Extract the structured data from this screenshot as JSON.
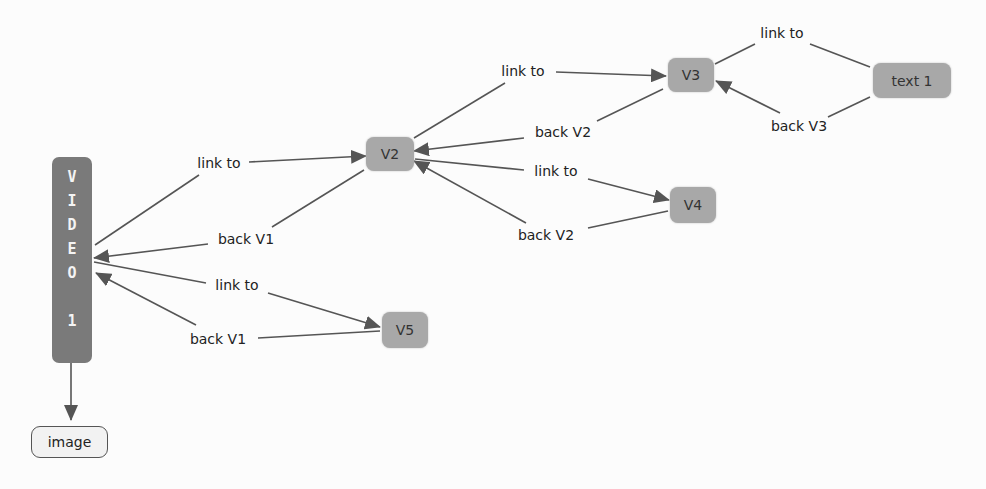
{
  "diagram": {
    "type": "concept-map",
    "colors": {
      "background": "#fcfcfc",
      "node_gray": "#a8a8a8",
      "node_dark": "#7a7a7a",
      "node_light": "#f2f2f2",
      "edge": "#555555"
    },
    "nodes": {
      "video1": {
        "label": "VIDEO 1",
        "letters": [
          "V",
          "I",
          "D",
          "E",
          "O",
          "",
          "1"
        ]
      },
      "image": {
        "label": "image"
      },
      "v2": {
        "label": "V2"
      },
      "v3": {
        "label": "V3"
      },
      "v4": {
        "label": "V4"
      },
      "v5": {
        "label": "V5"
      },
      "text1": {
        "label": "text 1"
      }
    },
    "edges": [
      {
        "from": "VIDEO 1",
        "to": "V2",
        "label": "link to"
      },
      {
        "from": "V2",
        "to": "VIDEO 1",
        "label": "back V1"
      },
      {
        "from": "VIDEO 1",
        "to": "V5",
        "label": "link to"
      },
      {
        "from": "V5",
        "to": "VIDEO 1",
        "label": "back V1"
      },
      {
        "from": "V2",
        "to": "V3",
        "label": "link to"
      },
      {
        "from": "V3",
        "to": "V2",
        "label": "back V2"
      },
      {
        "from": "V2",
        "to": "V4",
        "label": "link to"
      },
      {
        "from": "V4",
        "to": "V2",
        "label": "back V2"
      },
      {
        "from": "V3",
        "to": "text 1",
        "label": "link to"
      },
      {
        "from": "text 1",
        "to": "V3",
        "label": "back V3"
      },
      {
        "from": "VIDEO 1",
        "to": "image",
        "label": ""
      }
    ]
  }
}
